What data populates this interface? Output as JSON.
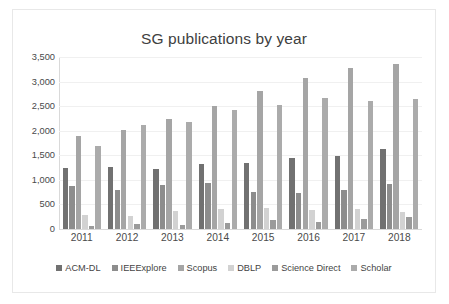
{
  "chart_data": {
    "type": "bar",
    "title": "SG publications by year",
    "xlabel": "",
    "ylabel": "",
    "ylim": [
      0,
      3500
    ],
    "yticks": [
      "3,500",
      "3,000",
      "2,500",
      "2,000",
      "1,500",
      "1,000",
      "500",
      "0"
    ],
    "ytick_values": [
      3500,
      3000,
      2500,
      2000,
      1500,
      1000,
      500,
      0
    ],
    "grid": true,
    "legend_position": "bottom",
    "categories": [
      "2011",
      "2012",
      "2013",
      "2014",
      "2015",
      "2016",
      "2017",
      "2018"
    ],
    "series": [
      {
        "name": "ACM-DL",
        "color": "#717171",
        "values": [
          1240,
          1270,
          1220,
          1330,
          1340,
          1440,
          1490,
          1620
        ]
      },
      {
        "name": "IEEExplore",
        "color": "#8d8d8d",
        "values": [
          870,
          800,
          890,
          930,
          750,
          730,
          800,
          920
        ]
      },
      {
        "name": "Scopus",
        "color": "#a5a5a5",
        "values": [
          1900,
          2010,
          2230,
          2500,
          2800,
          3080,
          3270,
          3360
        ]
      },
      {
        "name": "DBLP",
        "color": "#d2d2d2",
        "values": [
          290,
          260,
          360,
          400,
          420,
          380,
          410,
          340
        ]
      },
      {
        "name": "Science Direct",
        "color": "#9b9b9b",
        "values": [
          70,
          110,
          90,
          130,
          180,
          140,
          200,
          240
        ]
      },
      {
        "name": "Scholar",
        "color": "#ababab",
        "values": [
          1680,
          2110,
          2180,
          2420,
          2530,
          2670,
          2600,
          2640
        ]
      }
    ]
  }
}
